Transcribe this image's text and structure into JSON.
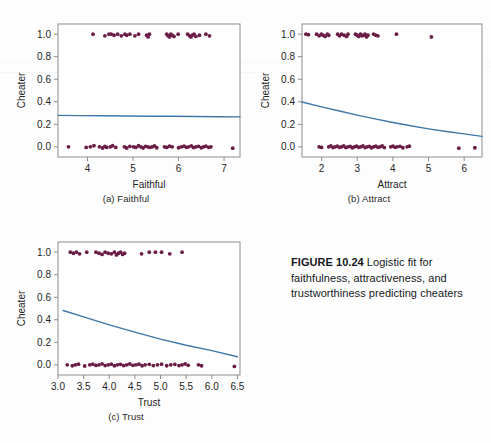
{
  "figure": {
    "caption_bold": "FIGURE 10.24",
    "caption_rest": " Logistic fit for faithfulness, attractiveness, and trustworthiness predicting cheaters"
  },
  "style": {
    "point_color": "#6b1d46",
    "line_color": "#3f77a8",
    "frame_color": "#8d8d8d",
    "text_color": "#242424",
    "background": "#fdfdfd"
  },
  "chart_data": [
    {
      "id": "panel-a",
      "type": "scatter",
      "title": "",
      "subcaption": "(a) Faithful",
      "xlabel": "Faithful",
      "ylabel": "Cheater",
      "xlim": [
        3.35,
        7.35
      ],
      "ylim": [
        -0.09,
        1.09
      ],
      "xticks": [
        4,
        5,
        6,
        7
      ],
      "xticklabels": [
        "4",
        "5",
        "6",
        "7"
      ],
      "yticks": [
        0.0,
        0.2,
        0.4,
        0.6,
        0.8,
        1.0
      ],
      "yticklabels": [
        "0.0",
        "0.2",
        "0.4",
        "0.6",
        "0.8",
        "1.0"
      ],
      "grid": false,
      "legend": "none",
      "fit_label": "logistic fit",
      "fit_curve": {
        "x": [
          3.35,
          3.85,
          4.35,
          4.85,
          5.35,
          5.85,
          6.35,
          6.85,
          7.35
        ],
        "y": [
          0.279,
          0.277,
          0.276,
          0.274,
          0.272,
          0.271,
          0.269,
          0.267,
          0.266
        ]
      },
      "points_y1": [
        [
          4.12,
          1.0
        ],
        [
          4.38,
          0.985
        ],
        [
          4.47,
          1.0
        ],
        [
          4.52,
          1.0
        ],
        [
          4.58,
          0.99
        ],
        [
          4.66,
          1.0
        ],
        [
          4.74,
          0.985
        ],
        [
          4.82,
          1.0
        ],
        [
          4.86,
          0.99
        ],
        [
          4.93,
          1.0
        ],
        [
          5.04,
          0.985
        ],
        [
          5.12,
          1.0
        ],
        [
          5.3,
          0.99
        ],
        [
          5.33,
          0.975
        ],
        [
          5.36,
          1.0
        ],
        [
          5.74,
          1.0
        ],
        [
          5.77,
          0.985
        ],
        [
          5.8,
          0.975
        ],
        [
          5.83,
          1.0
        ],
        [
          5.86,
          0.99
        ],
        [
          5.9,
          0.98
        ],
        [
          5.99,
          1.0
        ],
        [
          6.2,
          1.0
        ],
        [
          6.24,
          0.985
        ],
        [
          6.27,
          0.975
        ],
        [
          6.3,
          0.99
        ],
        [
          6.34,
          1.0
        ],
        [
          6.38,
          0.98
        ],
        [
          6.46,
          0.99
        ],
        [
          6.6,
          1.0
        ],
        [
          6.68,
          0.985
        ]
      ],
      "points_y0": [
        [
          3.58,
          0.0
        ],
        [
          3.97,
          -0.005
        ],
        [
          4.06,
          0.0
        ],
        [
          4.14,
          0.01
        ],
        [
          4.26,
          0.0
        ],
        [
          4.33,
          -0.01
        ],
        [
          4.38,
          0.005
        ],
        [
          4.42,
          -0.005
        ],
        [
          4.5,
          0.0
        ],
        [
          4.55,
          0.01
        ],
        [
          4.62,
          -0.005
        ],
        [
          4.81,
          0.0
        ],
        [
          4.86,
          -0.01
        ],
        [
          4.93,
          0.005
        ],
        [
          5.01,
          0.0
        ],
        [
          5.06,
          -0.005
        ],
        [
          5.12,
          0.01
        ],
        [
          5.17,
          0.0
        ],
        [
          5.22,
          -0.01
        ],
        [
          5.27,
          0.005
        ],
        [
          5.32,
          0.0
        ],
        [
          5.37,
          -0.005
        ],
        [
          5.42,
          0.0
        ],
        [
          5.47,
          0.008
        ],
        [
          5.52,
          -0.008
        ],
        [
          5.69,
          0.0
        ],
        [
          5.74,
          -0.005
        ],
        [
          5.8,
          0.006
        ],
        [
          5.86,
          0.0
        ],
        [
          6.0,
          -0.008
        ],
        [
          6.06,
          0.0
        ],
        [
          6.12,
          0.006
        ],
        [
          6.17,
          -0.004
        ],
        [
          6.22,
          0.0
        ],
        [
          6.28,
          0.008
        ],
        [
          6.33,
          -0.006
        ],
        [
          6.38,
          0.0
        ],
        [
          6.44,
          0.005
        ],
        [
          6.5,
          -0.008
        ],
        [
          6.55,
          0.0
        ],
        [
          6.6,
          0.006
        ],
        [
          6.66,
          -0.004
        ],
        [
          6.71,
          0.0
        ],
        [
          7.19,
          -0.012
        ]
      ]
    },
    {
      "id": "panel-b",
      "type": "scatter",
      "title": "",
      "subcaption": "(b) Attract",
      "xlabel": "Attract",
      "ylabel": "Cheater",
      "xlim": [
        1.45,
        6.5
      ],
      "ylim": [
        -0.09,
        1.09
      ],
      "xticks": [
        2,
        3,
        4,
        5,
        6
      ],
      "xticklabels": [
        "2",
        "3",
        "4",
        "5",
        "6"
      ],
      "yticks": [
        0.0,
        0.2,
        0.4,
        0.6,
        0.8,
        1.0
      ],
      "yticklabels": [
        "0.0",
        "0.2",
        "0.4",
        "0.6",
        "0.8",
        "1.0"
      ],
      "grid": false,
      "legend": "none",
      "fit_label": "logistic fit",
      "fit_curve": {
        "x": [
          1.45,
          2.0,
          2.5,
          3.0,
          3.5,
          4.0,
          4.5,
          5.0,
          5.5,
          6.0,
          6.5
        ],
        "y": [
          0.398,
          0.355,
          0.318,
          0.282,
          0.248,
          0.216,
          0.187,
          0.16,
          0.136,
          0.115,
          0.093
        ]
      },
      "points_y1": [
        [
          1.56,
          1.0
        ],
        [
          1.63,
          0.995
        ],
        [
          1.86,
          1.0
        ],
        [
          1.93,
          0.985
        ],
        [
          1.99,
          1.0
        ],
        [
          2.04,
          0.99
        ],
        [
          2.1,
          0.98
        ],
        [
          2.16,
          1.0
        ],
        [
          2.2,
          0.99
        ],
        [
          2.45,
          1.0
        ],
        [
          2.5,
          0.985
        ],
        [
          2.56,
          1.0
        ],
        [
          2.63,
          0.99
        ],
        [
          2.7,
          0.98
        ],
        [
          2.74,
          1.0
        ],
        [
          2.95,
          1.0
        ],
        [
          3.0,
          0.99
        ],
        [
          3.04,
          0.98
        ],
        [
          3.09,
          1.0
        ],
        [
          3.13,
          0.985
        ],
        [
          3.18,
          0.99
        ],
        [
          3.22,
          1.0
        ],
        [
          3.26,
          0.975
        ],
        [
          3.3,
          0.99
        ],
        [
          3.46,
          1.0
        ],
        [
          3.52,
          0.99
        ],
        [
          3.58,
          0.985
        ],
        [
          4.1,
          1.0
        ],
        [
          5.08,
          0.975
        ]
      ],
      "points_y0": [
        [
          1.93,
          0.0
        ],
        [
          2.0,
          -0.005
        ],
        [
          2.2,
          0.0
        ],
        [
          2.26,
          0.008
        ],
        [
          2.32,
          -0.006
        ],
        [
          2.38,
          0.0
        ],
        [
          2.44,
          0.006
        ],
        [
          2.5,
          -0.004
        ],
        [
          2.56,
          0.0
        ],
        [
          2.62,
          0.008
        ],
        [
          2.68,
          -0.006
        ],
        [
          2.74,
          0.0
        ],
        [
          2.8,
          0.005
        ],
        [
          2.86,
          -0.008
        ],
        [
          2.92,
          0.0
        ],
        [
          2.98,
          0.006
        ],
        [
          3.04,
          -0.004
        ],
        [
          3.1,
          0.0
        ],
        [
          3.16,
          0.008
        ],
        [
          3.22,
          -0.006
        ],
        [
          3.28,
          0.0
        ],
        [
          3.34,
          0.005
        ],
        [
          3.4,
          -0.008
        ],
        [
          3.46,
          0.0
        ],
        [
          3.52,
          0.006
        ],
        [
          3.58,
          -0.004
        ],
        [
          3.64,
          0.0
        ],
        [
          3.7,
          0.008
        ],
        [
          3.76,
          -0.006
        ],
        [
          3.94,
          0.0
        ],
        [
          4.0,
          0.006
        ],
        [
          4.06,
          -0.004
        ],
        [
          4.12,
          0.0
        ],
        [
          4.2,
          0.005
        ],
        [
          4.28,
          -0.008
        ],
        [
          4.4,
          0.0
        ],
        [
          4.46,
          0.006
        ],
        [
          5.85,
          -0.012
        ],
        [
          6.3,
          -0.008
        ]
      ]
    },
    {
      "id": "panel-c",
      "type": "scatter",
      "title": "",
      "subcaption": "(c) Trust",
      "xlabel": "Trust",
      "ylabel": "Cheater",
      "xlim": [
        3.0,
        6.55
      ],
      "ylim": [
        -0.09,
        1.09
      ],
      "xticks": [
        3.0,
        3.5,
        4.0,
        4.5,
        5.0,
        5.5,
        6.0,
        6.5
      ],
      "xticklabels": [
        "3.0",
        "3.5",
        "4.0",
        "4.5",
        "5.0",
        "5.5",
        "6.0",
        "6.5"
      ],
      "yticks": [
        0.0,
        0.2,
        0.4,
        0.6,
        0.8,
        1.0
      ],
      "yticklabels": [
        "0.0",
        "0.2",
        "0.4",
        "0.6",
        "0.8",
        "1.0"
      ],
      "grid": false,
      "legend": "none",
      "fit_label": "logistic fit",
      "fit_curve": {
        "x": [
          3.1,
          3.5,
          4.0,
          4.5,
          5.0,
          5.5,
          6.0,
          6.5
        ],
        "y": [
          0.482,
          0.425,
          0.355,
          0.29,
          0.228,
          0.174,
          0.126,
          0.072
        ]
      },
      "points_y1": [
        [
          3.24,
          1.0
        ],
        [
          3.3,
          0.99
        ],
        [
          3.36,
          1.0
        ],
        [
          3.42,
          0.985
        ],
        [
          3.56,
          1.0
        ],
        [
          3.74,
          1.0
        ],
        [
          3.8,
          0.99
        ],
        [
          3.86,
          0.98
        ],
        [
          3.92,
          1.0
        ],
        [
          3.98,
          0.99
        ],
        [
          4.04,
          0.985
        ],
        [
          4.1,
          1.0
        ],
        [
          4.14,
          0.975
        ],
        [
          4.18,
          0.99
        ],
        [
          4.22,
          1.0
        ],
        [
          4.26,
          0.98
        ],
        [
          4.3,
          0.99
        ],
        [
          4.63,
          0.985
        ],
        [
          4.78,
          1.0
        ],
        [
          4.9,
          1.0
        ],
        [
          5.02,
          1.0
        ],
        [
          5.18,
          0.985
        ],
        [
          5.42,
          1.0
        ]
      ],
      "points_y0": [
        [
          3.18,
          0.0
        ],
        [
          3.28,
          -0.008
        ],
        [
          3.34,
          0.0
        ],
        [
          3.4,
          0.006
        ],
        [
          3.52,
          -0.01
        ],
        [
          3.62,
          0.0
        ],
        [
          3.68,
          0.006
        ],
        [
          3.74,
          -0.005
        ],
        [
          3.8,
          0.0
        ],
        [
          3.86,
          0.008
        ],
        [
          3.92,
          -0.006
        ],
        [
          3.98,
          0.0
        ],
        [
          4.04,
          0.006
        ],
        [
          4.1,
          -0.008
        ],
        [
          4.16,
          0.0
        ],
        [
          4.22,
          0.005
        ],
        [
          4.28,
          -0.006
        ],
        [
          4.34,
          0.0
        ],
        [
          4.4,
          0.008
        ],
        [
          4.46,
          -0.004
        ],
        [
          4.52,
          0.0
        ],
        [
          4.58,
          0.006
        ],
        [
          4.64,
          -0.008
        ],
        [
          4.7,
          0.0
        ],
        [
          4.78,
          0.005
        ],
        [
          4.86,
          -0.006
        ],
        [
          4.94,
          0.0
        ],
        [
          5.02,
          0.006
        ],
        [
          5.12,
          -0.008
        ],
        [
          5.2,
          0.0
        ],
        [
          5.28,
          0.005
        ],
        [
          5.36,
          -0.006
        ],
        [
          5.42,
          0.0
        ],
        [
          5.48,
          0.008
        ],
        [
          5.54,
          -0.004
        ],
        [
          5.74,
          0.0
        ],
        [
          5.8,
          -0.008
        ],
        [
          6.44,
          -0.014
        ]
      ]
    }
  ]
}
